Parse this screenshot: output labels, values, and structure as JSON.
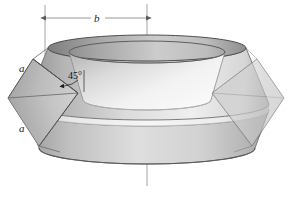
{
  "figure": {
    "background_color": "#ffffff",
    "width": 292,
    "height": 198
  },
  "annotations": {
    "radius_label": "b",
    "side_label_upper": "a",
    "side_label_lower": "a",
    "angle_label": "45°"
  },
  "dimension_line": {
    "name": "radius-dimension-b",
    "left_x": 45,
    "right_x": 147,
    "y": 18,
    "extension_top_y": 5,
    "extension_bottom_y": 57
  },
  "axis": {
    "name": "center-axis",
    "x": 147,
    "top_y": 4,
    "bottom_y": 186
  },
  "geometry": {
    "center_x": 147,
    "top_ellipse_cy": 48,
    "top_ellipse_rx": 99,
    "top_ellipse_ry": 13,
    "inner_ellipse_cy": 52,
    "inner_ellipse_rx": 78,
    "inner_ellipse_ry": 11,
    "mid_ellipse_cy": 110,
    "mid_ellipse_rx": 122,
    "mid_ellipse_ry": 16,
    "bottom_ellipse_cy": 148,
    "bottom_ellipse_rx": 108,
    "bottom_ellipse_ry": 16,
    "left_diamond": {
      "top": [
        33,
        59
      ],
      "left": [
        8,
        98
      ],
      "bottom": [
        39,
        146
      ],
      "right": [
        78,
        93
      ]
    },
    "right_diamond": {
      "top": [
        257,
        59
      ],
      "right": [
        284,
        98
      ],
      "bottom": [
        252,
        146
      ],
      "left": [
        212,
        93
      ]
    }
  },
  "colors": {
    "outline": "#4a4a4a",
    "thin_line": "#8c8c8c",
    "dim_line": "#7d7d7d",
    "band_light": "#f2f2f2",
    "band_mid": "#d8d8d8",
    "band_dark": "#a9a9a9",
    "facet_left": "#b8b8b8",
    "facet_right": "#c9c9c9",
    "inner_cone": "#efefef"
  }
}
